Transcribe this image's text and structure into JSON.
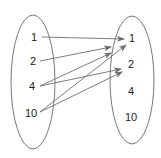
{
  "diagram": {
    "type": "mapping",
    "domain": {
      "values": [
        "1",
        "2",
        "4",
        "10"
      ]
    },
    "codomain": {
      "values": [
        "1",
        "2",
        "4",
        "10"
      ]
    },
    "arrows": [
      {
        "from": "1",
        "to": "1"
      },
      {
        "from": "2",
        "to": "1"
      },
      {
        "from": "4",
        "to": "1"
      },
      {
        "from": "4",
        "to": "2"
      },
      {
        "from": "10",
        "to": "1"
      },
      {
        "from": "10",
        "to": "2"
      }
    ],
    "colors": {
      "stroke": "#777777",
      "text": "#222222",
      "arrow": "#6e6e6e"
    }
  }
}
